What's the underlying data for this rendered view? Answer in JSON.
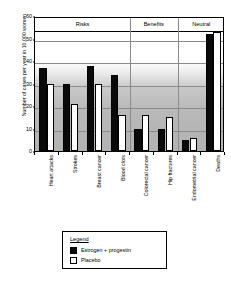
{
  "chart_data": {
    "type": "bar",
    "title": "",
    "xlabel": "",
    "ylabel": "Number of cases per year in 10,000 women",
    "ylim": [
      0,
      60
    ],
    "yticks": [
      0,
      10,
      20,
      30,
      40,
      50,
      60
    ],
    "grid": true,
    "legend_position": "below-chart",
    "categories": [
      "Heart attacks",
      "Strokes",
      "Breast cancer",
      "Blood clots",
      "Colorectal cancer",
      "Hip fractures",
      "Endometrial cancer",
      "Deaths"
    ],
    "series": [
      {
        "name": "Estrogen + progestin",
        "color": "#0a0a0a",
        "values": [
          37,
          30,
          38,
          34,
          10,
          10,
          5,
          52
        ]
      },
      {
        "name": "Placebo",
        "color": "#ffffff",
        "values": [
          30,
          21,
          30,
          16,
          16,
          15,
          6,
          53
        ]
      }
    ],
    "sections": [
      {
        "label": "Risks",
        "categories": [
          "Heart attacks",
          "Strokes",
          "Breast cancer",
          "Blood clots"
        ]
      },
      {
        "label": "Benefits",
        "categories": [
          "Colorectal cancer",
          "Hip fractures"
        ]
      },
      {
        "label": "Neutral",
        "categories": [
          "Endometrial cancer",
          "Deaths"
        ]
      }
    ]
  },
  "legend": {
    "title": "Legend",
    "entries": [
      {
        "label": "Estrogen + progestin",
        "swatch": "dark"
      },
      {
        "label": "Placebo",
        "swatch": "light"
      }
    ]
  }
}
